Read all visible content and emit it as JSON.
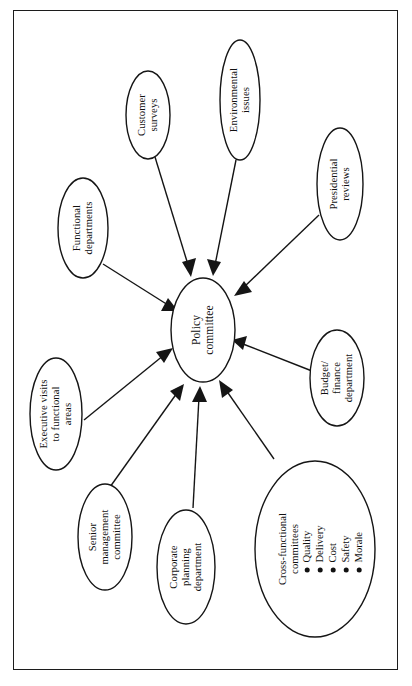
{
  "diagram": {
    "orientation": "rotated-90-ccw",
    "stroke_color": "#151515",
    "background_color": "#ffffff",
    "center": {
      "id": "policy-committee",
      "lines": [
        "Policy",
        "committee"
      ]
    },
    "nodes": [
      {
        "id": "customer-surveys",
        "lines": [
          "Customer",
          "surveys"
        ]
      },
      {
        "id": "environmental-issues",
        "lines": [
          "Environmental",
          "issues"
        ]
      },
      {
        "id": "presidential-reviews",
        "lines": [
          "Presidential",
          "reviews"
        ]
      },
      {
        "id": "functional-departments",
        "lines": [
          "Functional",
          "departments"
        ]
      },
      {
        "id": "executive-visits",
        "lines": [
          "Executive visits",
          "to functional",
          "areas"
        ]
      },
      {
        "id": "senior-management",
        "lines": [
          "Senior",
          "management",
          "committee"
        ]
      },
      {
        "id": "corporate-planning",
        "lines": [
          "Corporate",
          "planning",
          "department"
        ]
      },
      {
        "id": "budget-finance",
        "lines": [
          "Budget/",
          "finance",
          "department"
        ]
      },
      {
        "id": "cross-functional",
        "lines": [
          "Cross-functional",
          "committees"
        ]
      }
    ],
    "cross_functional_bullets": [
      "Quality",
      "Delivery",
      "Cost",
      "Safety",
      "Morale"
    ]
  }
}
